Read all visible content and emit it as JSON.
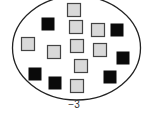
{
  "diagram": {
    "type": "integer-chip-model",
    "label": "−3",
    "colors": {
      "positive_fill": "#d9d9d9",
      "positive_stroke": "#444444",
      "negative_fill": "#0a0a0a",
      "ellipse_stroke": "#222222"
    },
    "chips": [
      {
        "kind": "positive",
        "x": 67,
        "y": 3
      },
      {
        "kind": "negative",
        "x": 41,
        "y": 17
      },
      {
        "kind": "positive",
        "x": 69,
        "y": 20
      },
      {
        "kind": "positive",
        "x": 91,
        "y": 23
      },
      {
        "kind": "negative",
        "x": 110,
        "y": 23
      },
      {
        "kind": "positive",
        "x": 21,
        "y": 37
      },
      {
        "kind": "positive",
        "x": 47,
        "y": 45
      },
      {
        "kind": "positive",
        "x": 70,
        "y": 39
      },
      {
        "kind": "positive",
        "x": 93,
        "y": 43
      },
      {
        "kind": "negative",
        "x": 116,
        "y": 51
      },
      {
        "kind": "positive",
        "x": 74,
        "y": 59
      },
      {
        "kind": "negative",
        "x": 28,
        "y": 67
      },
      {
        "kind": "negative",
        "x": 48,
        "y": 76
      },
      {
        "kind": "positive",
        "x": 70,
        "y": 79
      },
      {
        "kind": "negative",
        "x": 103,
        "y": 70
      }
    ],
    "counts": {
      "positive": 9,
      "negative": 6
    }
  }
}
